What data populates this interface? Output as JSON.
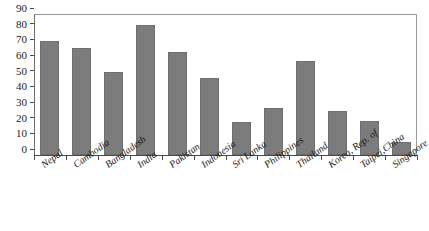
{
  "chart_data": {
    "type": "bar",
    "title": "",
    "subtitle": "",
    "xlabel": "",
    "ylabel": "",
    "ylim": [
      0,
      90
    ],
    "ytick_step": 10,
    "yticks": [
      90,
      80,
      70,
      60,
      50,
      40,
      30,
      20,
      10,
      0
    ],
    "grid": false,
    "legend": false,
    "legend_position": "none",
    "bar_color": "#7c7c7c",
    "categories": [
      "Nepal",
      "Cambodia",
      "Bangladesh",
      "India",
      "Pakistan",
      "Indonesia",
      "Sri Lanka",
      "Philippines",
      "Thailand",
      "Korea, Rep. of",
      "Taipei,China",
      "Singapore"
    ],
    "values": [
      73,
      68,
      53,
      83,
      66,
      49,
      21,
      30,
      60,
      28,
      22,
      8
    ]
  }
}
